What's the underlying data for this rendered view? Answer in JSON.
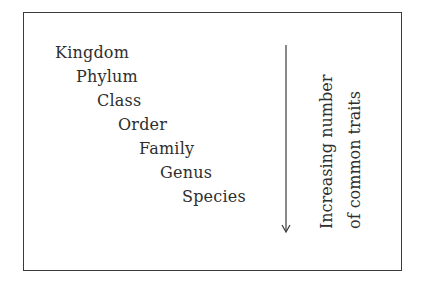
{
  "ranks": [
    "Kingdom",
    "Phylum",
    "Class",
    "Order",
    "Family",
    "Genus",
    "Species"
  ],
  "arrow_label": {
    "line1": "Increasing number",
    "line2": "of common traits"
  },
  "arrow_direction": "down",
  "colors": {
    "text": "#2e2e2e",
    "border": "#3a3a3a",
    "background": "#ffffff"
  }
}
